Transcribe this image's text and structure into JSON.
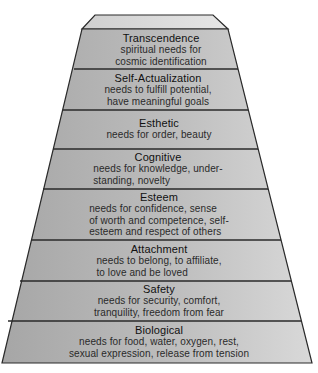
{
  "diagram": {
    "type": "pyramid",
    "colors": {
      "cap_fill": "#dcdcdc",
      "layer_fill_dark": "#a9a9a9",
      "layer_fill_light": "#d6d6d6",
      "line": "#2a2a2a"
    },
    "layers": [
      {
        "title": "Transcendence",
        "desc": "spiritual needs for\ncosmic identification"
      },
      {
        "title": "Self-Actualization",
        "desc": "needs to fulfill potential,\nhave meaningful goals"
      },
      {
        "title": "Esthetic",
        "desc": "needs for order, beauty"
      },
      {
        "title": "Cognitive",
        "desc": "needs for knowledge, under-\nstanding, novelty"
      },
      {
        "title": "Esteem",
        "desc": "needs for confidence, sense\nof worth and competence, self-\nesteem and respect of others"
      },
      {
        "title": "Attachment",
        "desc": "needs to belong, to affiliate,\nto love and be loved"
      },
      {
        "title": "Safety",
        "desc": "needs for security, comfort,\ntranquility, freedom from fear"
      },
      {
        "title": "Biological",
        "desc": "needs for food, water, oxygen, rest,\nsexual expression, release from tension"
      }
    ]
  }
}
